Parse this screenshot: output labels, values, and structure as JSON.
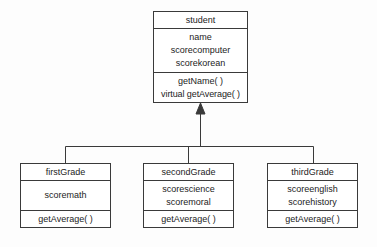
{
  "diagram": {
    "type": "uml-class-diagram",
    "relationship": "inheritance",
    "base_class": {
      "name": "student",
      "attributes": [
        "name",
        "scorecomputer",
        "scorekorean"
      ],
      "methods": [
        "getName(  )",
        "virtual getAverage(  )"
      ]
    },
    "derived_classes": [
      {
        "name": "firstGrade",
        "attributes": [
          "scoremath"
        ],
        "methods": [
          "getAverage(  )"
        ]
      },
      {
        "name": "secondGrade",
        "attributes": [
          "scorescience",
          "scoremoral"
        ],
        "methods": [
          "getAverage(  )"
        ]
      },
      {
        "name": "thirdGrade",
        "attributes": [
          "scoreenglish",
          "scorehistory"
        ],
        "methods": [
          "getAverage(  )"
        ]
      }
    ]
  },
  "colors": {
    "line": "#3a3a3a",
    "text": "#1c1c1c",
    "background": "#fdfdfd",
    "box_fill": "#ffffff"
  }
}
